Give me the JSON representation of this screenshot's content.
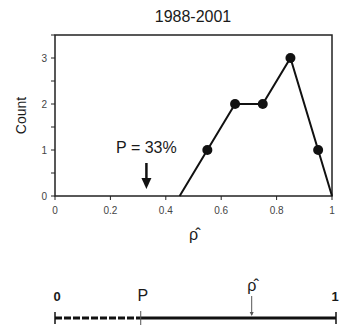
{
  "chart_data": {
    "type": "line",
    "title": "1988-2001",
    "xlabel": "ρ̂",
    "ylabel": "Count",
    "xlim": [
      0,
      1
    ],
    "ylim": [
      0,
      3.5
    ],
    "x_ticks": [
      "0",
      "0.2",
      "0.4",
      "0.6",
      "0.8",
      "1"
    ],
    "y_ticks": [
      "0",
      "1",
      "2",
      "3"
    ],
    "grid": false,
    "series": [
      {
        "name": "count",
        "x": [
          0.45,
          0.55,
          0.65,
          0.75,
          0.85,
          0.95,
          1.0
        ],
        "y": [
          0,
          1,
          2,
          2,
          3,
          1,
          0
        ],
        "markers": [
          false,
          true,
          true,
          true,
          true,
          true,
          false
        ]
      }
    ],
    "annotations": [
      {
        "text": "P = 33%",
        "x": 0.33,
        "arrow": "down"
      }
    ],
    "number_line": {
      "start_label": "0",
      "end_label": "1",
      "p_label": "P",
      "rho_label": "ρ̂",
      "p_value": 0.33,
      "rho_value": 0.7,
      "segment_left_style": "dashed",
      "segment_right_style": "solid"
    }
  }
}
